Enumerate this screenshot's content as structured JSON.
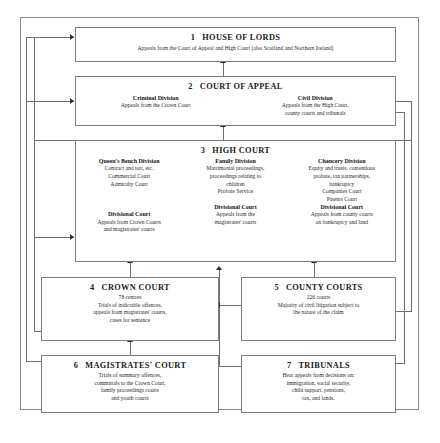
{
  "diagram": {
    "type": "hierarchy-flowchart",
    "boxes": [
      {
        "id": "house-of-lords",
        "number": "1",
        "title": "HOUSE OF LORDS",
        "lines": [
          "Appeals from the Court of Appeal and High Court (also Scotland and Northern Ireland)"
        ]
      },
      {
        "id": "court-of-appeal",
        "number": "2",
        "title": "COURT OF APPEAL",
        "columns": [
          {
            "heading": "Criminal Division",
            "lines": [
              "Appeals from the Crown Court"
            ]
          },
          {
            "heading": "Civil Division",
            "lines": [
              "Appeals from the High Court,",
              "county courts and tribunals"
            ]
          }
        ]
      },
      {
        "id": "high-court",
        "number": "3",
        "title": "HIGH COURT",
        "columns": [
          {
            "heading": "Queen's Bench Division",
            "lines": [
              "Contract and tort, etc.",
              "Commercial Court",
              "Admiralty Court"
            ],
            "sub_heading": "Divisional Court",
            "sub_lines": [
              "Appeals from Crown Courts",
              "and magistrates' courts"
            ]
          },
          {
            "heading": "Family Division",
            "lines": [
              "Matrimonial proceedings,",
              "proceedings relating to",
              "children",
              "Probate Service"
            ],
            "sub_heading": "Divisional Court",
            "sub_lines": [
              "Appeals from the",
              "magistrates' courts"
            ]
          },
          {
            "heading": "Chancery Division",
            "lines": [
              "Equity and trusts, contentious",
              "probate, tax partnerships,",
              "bankruptcy",
              "Companies Court",
              "Patents Court"
            ],
            "sub_heading": "Divisional Court",
            "sub_lines": [
              "Appeals from county courts",
              "on bankruptcy and land"
            ]
          }
        ]
      },
      {
        "id": "crown-court",
        "number": "4",
        "title": "CROWN COURT",
        "lines": [
          "78 centres",
          "Trials of indictable offences,",
          "appeals from magistrates' courts,",
          "cases for sentence"
        ]
      },
      {
        "id": "county-courts",
        "number": "5",
        "title": "COUNTY COURTS",
        "lines": [
          "226 courts",
          "Majority of civil litigation subject to",
          "the nature of the claim"
        ]
      },
      {
        "id": "magistrates-court",
        "number": "6",
        "title": "MAGISTRATES' COURT",
        "lines": [
          "Trials of summary offences,",
          "committals to the Crown Court,",
          "family proceedings courts",
          "and youth courts"
        ]
      },
      {
        "id": "tribunals",
        "number": "7",
        "title": "TRIBUNALS",
        "lines": [
          "Hear appeals from decisions on:",
          "immigration, social security,",
          "child support, pensions,",
          "tax, and lands."
        ]
      }
    ],
    "colors": {
      "box_border": "#7d7d7d",
      "frame_border": "#8a8a8a",
      "connector": "#6f6f6f",
      "arrowhead": "#2b2b2b",
      "text": "#1a1a1a",
      "background": "#ffffff"
    }
  }
}
